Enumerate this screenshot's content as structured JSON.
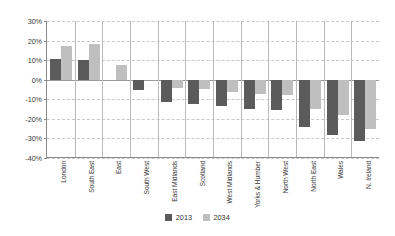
{
  "chart_data": {
    "type": "bar",
    "title": "",
    "subtitle": "",
    "xlabel": "",
    "ylabel": "",
    "ylim": [
      -40,
      30
    ],
    "ytick_values": [
      30,
      20,
      10,
      0,
      -10,
      -20,
      -30,
      -40
    ],
    "ytick_labels": [
      "30%",
      "20%",
      "10%",
      "0%",
      "-10%",
      "-20%",
      "-30%",
      "-40%"
    ],
    "grid": true,
    "grid_axis": "y",
    "legend_position": "bottom-center",
    "categories": [
      "London",
      "South East",
      "East",
      "South West",
      "East Midlands",
      "Scotland",
      "West Midlands",
      "Yorks & Humber",
      "North West",
      "North East",
      "Wales",
      "N. Ireland"
    ],
    "series": [
      {
        "name": "2013",
        "color": "#5b5b5b",
        "values": [
          10.5,
          10.0,
          0.0,
          -5.5,
          -11.5,
          -12.5,
          -13.5,
          -15.0,
          -15.5,
          -24.0,
          -28.0,
          -31.5
        ]
      },
      {
        "name": "2034",
        "color": "#bfbfbf",
        "values": [
          17.0,
          18.5,
          7.5,
          0.0,
          -4.0,
          -5.0,
          -6.5,
          -7.5,
          -8.0,
          -15.0,
          -18.0,
          -25.0
        ]
      }
    ]
  },
  "legend": {
    "items": [
      {
        "label": "2013",
        "color": "#5b5b5b"
      },
      {
        "label": "2034",
        "color": "#bfbfbf"
      }
    ]
  },
  "colors": {
    "series_2013": "#5b5b5b",
    "series_2034": "#bfbfbf",
    "gridline": "#c9c9c9",
    "axis": "#8a8a8a",
    "background": "#ffffff",
    "text": "#3d3d3d"
  }
}
